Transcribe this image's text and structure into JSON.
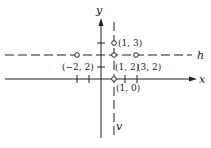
{
  "axes": {
    "x_label": "x",
    "y_label": "y"
  },
  "lines": {
    "h_label": "h",
    "v_label": "v"
  },
  "points": [
    {
      "label": "(1, 3)",
      "x": 1,
      "y": 3
    },
    {
      "label": "(−2, 2)",
      "x": -2,
      "y": 2
    },
    {
      "label": "(1, 2)",
      "x": 1,
      "y": 2
    },
    {
      "label": "(3, 2)",
      "x": 3,
      "y": 2
    },
    {
      "label": "(1, 0)",
      "x": 1,
      "y": 0
    }
  ],
  "colors": {
    "ink": "#222222",
    "background": "#ffffff"
  }
}
